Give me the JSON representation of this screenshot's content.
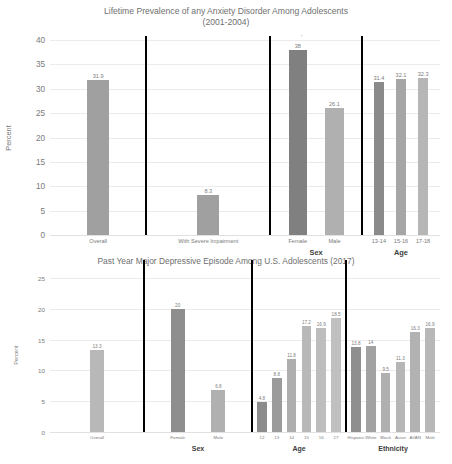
{
  "figure": {
    "background": "#ffffff",
    "text_color": "#6f6f6f"
  },
  "chart_data": [
    {
      "type": "bar",
      "title": "Lifetime Prevalence of any Anxiety Disorder Among Adolescents (2001-2004)",
      "title_line1": "Lifetime Prevalence of any Anxiety Disorder Among Adolescents",
      "title_line2": "(2001-2004)",
      "xlabel": "",
      "ylabel": "Percent",
      "ylim": [
        0,
        40
      ],
      "yticks": [
        0,
        5,
        10,
        15,
        20,
        25,
        30,
        35,
        40
      ],
      "ytick_labels": [
        "0",
        "5",
        "10",
        "15",
        "20",
        "25",
        "30",
        "35",
        "40"
      ],
      "grid": true,
      "legend": "none",
      "group_labels": [
        "",
        "",
        "Sex",
        "Age"
      ],
      "groups": [
        {
          "name": "",
          "categories": [
            "Overall"
          ],
          "values": [
            31.9
          ],
          "value_labels": [
            "31.9"
          ],
          "colors": [
            "#a0a0a0"
          ]
        },
        {
          "name": "",
          "categories": [
            "With Severe Impairment"
          ],
          "values": [
            8.3
          ],
          "value_labels": [
            "8.3"
          ],
          "colors": [
            "#a0a0a0"
          ]
        },
        {
          "name": "Sex",
          "categories": [
            "Female",
            "Male"
          ],
          "values": [
            38,
            26.1
          ],
          "value_labels": [
            "38",
            "26.1"
          ],
          "colors": [
            "#808080",
            "#b0b0b0"
          ]
        },
        {
          "name": "Age",
          "categories": [
            "13-14",
            "15-16",
            "17-18"
          ],
          "values": [
            31.4,
            32.1,
            32.3
          ],
          "value_labels": [
            "31.4",
            "32.1",
            "32.3"
          ],
          "colors": [
            "#8a8a8a",
            "#a6a6a6",
            "#b6b6b6"
          ]
        }
      ]
    },
    {
      "type": "bar",
      "title": "Past Year Major Depressive Episode Among U.S. Adolescents (2017)",
      "title_line1": "Past Year Major Depressive Episode Among U.S. Adolescents (2017)",
      "title_line2": "",
      "xlabel": "",
      "ylabel": "Percent",
      "ylim": [
        0,
        25
      ],
      "yticks": [
        0,
        5,
        10,
        15,
        20,
        25
      ],
      "ytick_labels": [
        "0",
        "5",
        "10",
        "15",
        "20",
        "25"
      ],
      "grid": true,
      "legend": "none",
      "group_labels": [
        "",
        "Sex",
        "Age",
        "Ethnicity"
      ],
      "groups": [
        {
          "name": "",
          "categories": [
            "Overall"
          ],
          "values": [
            13.3
          ],
          "value_labels": [
            "13.3"
          ],
          "colors": [
            "#b8b8b8"
          ]
        },
        {
          "name": "Sex",
          "categories": [
            "Female",
            "Male"
          ],
          "values": [
            20,
            6.8
          ],
          "value_labels": [
            "20",
            "6.8"
          ],
          "colors": [
            "#8e8e8e",
            "#b0b0b0"
          ]
        },
        {
          "name": "Age",
          "categories": [
            "12",
            "13",
            "14",
            "15",
            "16",
            "17"
          ],
          "values": [
            4.8,
            8.8,
            11.8,
            17.2,
            16.9,
            18.5
          ],
          "value_labels": [
            "4.8",
            "8.8",
            "11.8",
            "17.2",
            "16.9",
            "18.5"
          ],
          "colors": [
            "#8c8c8c",
            "#9b9b9b",
            "#aeaeae",
            "#b8b8b8",
            "#bdbdbd",
            "#c0c0c0"
          ]
        },
        {
          "name": "Ethnicity",
          "categories": [
            "Hispanic",
            "White",
            "Black",
            "Asian",
            "AI/AN",
            "Multi"
          ],
          "values": [
            13.8,
            14,
            9.5,
            11.3,
            16.3,
            16.9
          ],
          "value_labels": [
            "13.8",
            "14",
            "9.5",
            "11.3",
            "16.3",
            "16.9"
          ],
          "colors": [
            "#8f8f8f",
            "#a2a2a2",
            "#b0b0b0",
            "#b6b6b6",
            "#b2b2b2",
            "#b8b8b8"
          ]
        }
      ]
    }
  ]
}
